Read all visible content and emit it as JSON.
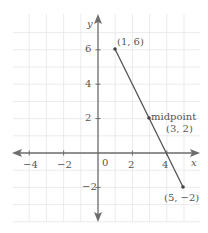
{
  "chart_data": {
    "type": "line",
    "title": "",
    "xlabel": "x",
    "ylabel": "y",
    "xlim": [
      -5,
      6
    ],
    "ylim": [
      -4,
      7
    ],
    "grid": true,
    "x_ticks": [
      -4,
      -2,
      0,
      2,
      4
    ],
    "y_ticks": [
      -2,
      2,
      4,
      6
    ],
    "origin_label": "0",
    "series": [
      {
        "name": "segment",
        "points": [
          {
            "x": 1,
            "y": 6,
            "label": "(1, 6)"
          },
          {
            "x": 3,
            "y": 2,
            "label": "(3, 2)",
            "annotation": "midpoint"
          },
          {
            "x": 5,
            "y": -2,
            "label": "(5, −2)"
          }
        ]
      }
    ],
    "annotations": [
      {
        "text": "midpoint",
        "x": 3,
        "y": 2
      },
      {
        "text": "(1, 6)",
        "x": 1,
        "y": 6
      },
      {
        "text": "(3, 2)",
        "x": 3,
        "y": 2
      },
      {
        "text": "(5, −2)",
        "x": 5,
        "y": -2
      }
    ]
  },
  "labels": {
    "x_axis": "x",
    "y_axis": "y",
    "origin": "0",
    "tick_x_neg4": "−4",
    "tick_x_neg2": "−2",
    "tick_x_2": "2",
    "tick_x_4": "4",
    "tick_y_6": "6",
    "tick_y_4": "4",
    "tick_y_2": "2",
    "tick_y_neg2": "−2",
    "point_a": "(1, 6)",
    "midpoint_word": "midpoint",
    "point_m": "(3, 2)",
    "point_b": "(5, −2)"
  },
  "colors": {
    "grid": "#e6e6e6",
    "axis": "#6e6e6e",
    "segment": "#555555",
    "text": "#555555"
  }
}
